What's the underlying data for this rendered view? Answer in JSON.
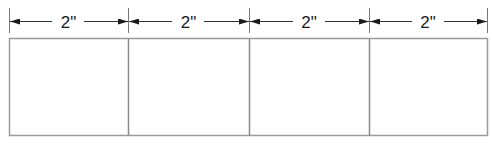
{
  "diagram": {
    "type": "dimensioned-panel-strip",
    "panel_count": 4,
    "dimensions": [
      {
        "label": "2\""
      },
      {
        "label": "2\""
      },
      {
        "label": "2\""
      },
      {
        "label": "2\""
      }
    ],
    "colors": {
      "line": "#555555",
      "frame": "#9a9a9a",
      "arrow": "#1a1a1a",
      "text": "#1a1a1a",
      "background": "#ffffff"
    }
  }
}
